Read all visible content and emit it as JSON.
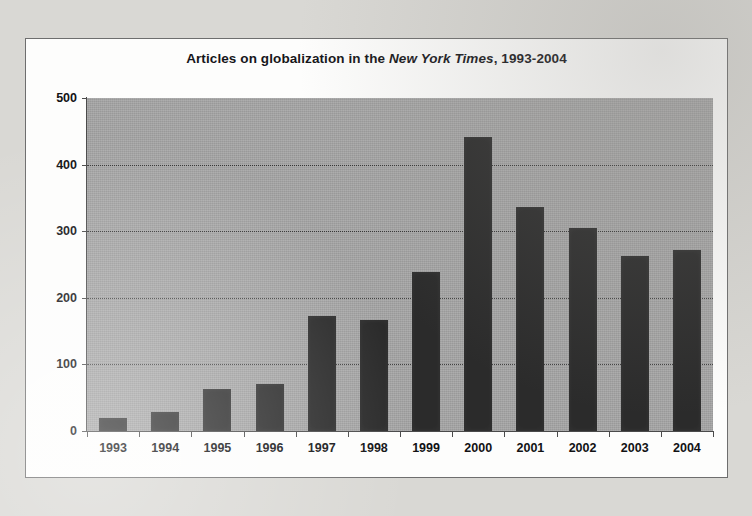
{
  "chart_data": {
    "type": "bar",
    "title_parts": {
      "before": "Articles on globalization in the ",
      "italic": "New York Times",
      "after": ", 1993-2004"
    },
    "title": "Articles on globalization in the New York Times, 1993-2004",
    "categories": [
      "1993",
      "1994",
      "1995",
      "1996",
      "1997",
      "1998",
      "1999",
      "2000",
      "2001",
      "2002",
      "2003",
      "2004"
    ],
    "values": [
      19,
      28,
      63,
      71,
      172,
      167,
      239,
      442,
      337,
      305,
      263,
      272
    ],
    "xlabel": "",
    "ylabel": "",
    "ylim": [
      0,
      500
    ],
    "ytick_labels": [
      "0",
      "100",
      "200",
      "300",
      "400",
      "500"
    ],
    "ytick_values": [
      0,
      100,
      200,
      300,
      400,
      500
    ],
    "grid": true,
    "grid_style": "dotted",
    "legend": false,
    "colors": {
      "bar": "#2b2b2b",
      "plot_background": "#a5a5a5",
      "chart_background": "#fdfdfc",
      "page_background": "#d9d8d4",
      "axis": "#4a4a4a",
      "text": "#121214",
      "border": "#6e6e6e"
    }
  }
}
